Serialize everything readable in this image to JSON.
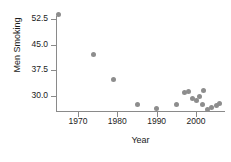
{
  "chart_data": {
    "type": "scatter",
    "title": "",
    "xlabel": "Year",
    "ylabel": "Men Smoking",
    "xlim": [
      1963,
      2008
    ],
    "ylim": [
      24.0,
      55.5
    ],
    "grid": false,
    "legend": null,
    "xticks": [
      1970,
      1980,
      1990,
      2000
    ],
    "xtick_labels": [
      "1970",
      "1980",
      "1990",
      "2000"
    ],
    "yticks": [
      30.0,
      37.5,
      45.0,
      52.5
    ],
    "ytick_labels": [
      "30.0",
      "37.5",
      "45.0",
      "52.5"
    ],
    "marker_color": "#8d8d8d",
    "axis_color": "#8a8a8a",
    "points": [
      {
        "x": 1965,
        "y": 53.8
      },
      {
        "x": 1974,
        "y": 42.0
      },
      {
        "x": 1979,
        "y": 34.9
      },
      {
        "x": 1985,
        "y": 27.5
      },
      {
        "x": 1990,
        "y": 26.3
      },
      {
        "x": 1995,
        "y": 27.4
      },
      {
        "x": 1997,
        "y": 31.0
      },
      {
        "x": 1998,
        "y": 31.3
      },
      {
        "x": 1999,
        "y": 29.2
      },
      {
        "x": 2000,
        "y": 28.7
      },
      {
        "x": 2001,
        "y": 30.0
      },
      {
        "x": 2001.6,
        "y": 27.4
      },
      {
        "x": 2002,
        "y": 31.5
      },
      {
        "x": 2003,
        "y": 26.2
      },
      {
        "x": 2004,
        "y": 26.5
      },
      {
        "x": 2005.2,
        "y": 27.3
      },
      {
        "x": 2006,
        "y": 27.8
      }
    ]
  }
}
